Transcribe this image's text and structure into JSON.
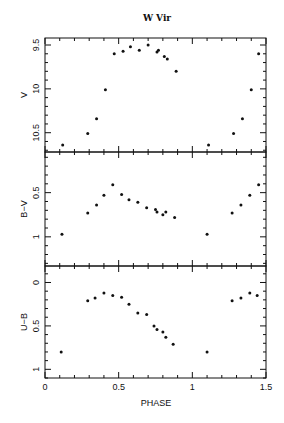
{
  "chart_data": {
    "type": "scatter",
    "title": "W Vir",
    "xlabel": "PHASE",
    "xlim": [
      0,
      1.5
    ],
    "x_ticks": [
      "0",
      "0.5",
      "1",
      "1.5"
    ],
    "x_tick_values": [
      0,
      0.5,
      1,
      1.5
    ],
    "x_minor_step": 0.1,
    "grid": false,
    "legend": "none",
    "panels": [
      {
        "ylabel": "V",
        "ylim": [
          9.42,
          10.72
        ],
        "y_inverted": true,
        "y_ticks": [
          "9.5",
          "10",
          "10.5"
        ],
        "y_tick_values": [
          9.5,
          10,
          10.5
        ],
        "y_minor_step": 0.1,
        "points": [
          [
            0.12,
            10.64
          ],
          [
            0.29,
            10.51
          ],
          [
            0.35,
            10.34
          ],
          [
            0.41,
            10.01
          ],
          [
            0.47,
            9.6
          ],
          [
            0.53,
            9.57
          ],
          [
            0.58,
            9.52
          ],
          [
            0.64,
            9.56
          ],
          [
            0.7,
            9.5
          ],
          [
            0.76,
            9.58
          ],
          [
            0.77,
            9.56
          ],
          [
            0.81,
            9.63
          ],
          [
            0.83,
            9.66
          ],
          [
            0.89,
            9.8
          ],
          [
            1.11,
            10.64
          ],
          [
            1.28,
            10.51
          ],
          [
            1.34,
            10.34
          ],
          [
            1.4,
            10.01
          ],
          [
            1.45,
            9.6
          ]
        ]
      },
      {
        "ylabel": "B−V",
        "ylim": [
          0.04,
          1.33
        ],
        "y_inverted": true,
        "y_ticks": [
          "0.5",
          "1"
        ],
        "y_tick_values": [
          0.5,
          1
        ],
        "y_minor_step": 0.1,
        "points": [
          [
            0.115,
            0.97
          ],
          [
            0.29,
            0.73
          ],
          [
            0.35,
            0.64
          ],
          [
            0.4,
            0.53
          ],
          [
            0.46,
            0.41
          ],
          [
            0.52,
            0.52
          ],
          [
            0.57,
            0.58
          ],
          [
            0.63,
            0.61
          ],
          [
            0.69,
            0.67
          ],
          [
            0.75,
            0.69
          ],
          [
            0.76,
            0.72
          ],
          [
            0.8,
            0.75
          ],
          [
            0.82,
            0.72
          ],
          [
            0.88,
            0.78
          ],
          [
            1.1,
            0.97
          ],
          [
            1.27,
            0.73
          ],
          [
            1.33,
            0.64
          ],
          [
            1.39,
            0.53
          ],
          [
            1.45,
            0.41
          ]
        ]
      },
      {
        "ylabel": "U−B",
        "ylim": [
          -0.19,
          1.1
        ],
        "y_inverted": true,
        "y_ticks": [
          "0",
          "0.5",
          "1"
        ],
        "y_tick_values": [
          0,
          0.5,
          1
        ],
        "y_minor_step": 0.1,
        "points": [
          [
            0.11,
            0.8
          ],
          [
            0.29,
            0.21
          ],
          [
            0.34,
            0.18
          ],
          [
            0.4,
            0.12
          ],
          [
            0.46,
            0.15
          ],
          [
            0.52,
            0.17
          ],
          [
            0.57,
            0.25
          ],
          [
            0.63,
            0.35
          ],
          [
            0.69,
            0.37
          ],
          [
            0.74,
            0.5
          ],
          [
            0.76,
            0.54
          ],
          [
            0.8,
            0.57
          ],
          [
            0.82,
            0.63
          ],
          [
            0.87,
            0.71
          ],
          [
            1.1,
            0.8
          ],
          [
            1.27,
            0.21
          ],
          [
            1.33,
            0.18
          ],
          [
            1.39,
            0.12
          ],
          [
            1.44,
            0.15
          ]
        ]
      }
    ]
  }
}
